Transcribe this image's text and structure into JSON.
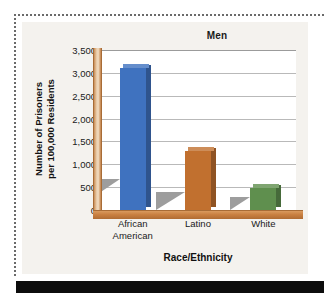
{
  "chart_data": {
    "type": "bar",
    "title": "Men",
    "xlabel": "Race/Ethnicity",
    "ylabel_lines": [
      "Number of Prisoners",
      "per 100,000 Residents"
    ],
    "ylabel": "Number of Prisoners per 100,000 Residents",
    "categories": [
      "African American",
      "Latino",
      "White"
    ],
    "category_lines": [
      [
        "African",
        "American"
      ],
      [
        "Latino"
      ],
      [
        "White"
      ]
    ],
    "values": [
      3100,
      1300,
      475
    ],
    "series": [
      {
        "name": "Men",
        "values": [
          3100,
          1300,
          475
        ]
      }
    ],
    "bar_colors": [
      "#3f72bf",
      "#c1702f",
      "#5f8f4e"
    ],
    "ylim": [
      0,
      3500
    ],
    "ytick_values": [
      3500,
      3000,
      2500,
      2000,
      1500,
      1000,
      500,
      0
    ],
    "ytick_labels": [
      "3,500",
      "3,000",
      "2,500",
      "2,000",
      "1,500",
      "1,000",
      "500",
      "0"
    ],
    "grid": true,
    "legend": "none",
    "style": "3d-bar",
    "plot_background": "#ffffff",
    "figure_background": "#f4f2ee",
    "axis_color": "#c9833f",
    "gridline_color": "#b9b9b9",
    "shadow_color": "#9d9d9d"
  }
}
